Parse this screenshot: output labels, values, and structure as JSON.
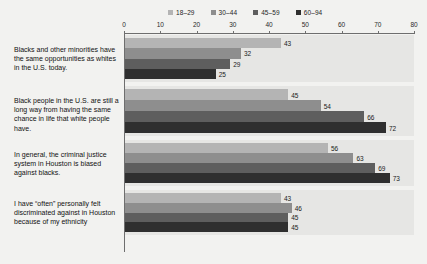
{
  "chart_data": {
    "type": "bar",
    "orientation": "horizontal",
    "title": "",
    "xlabel": "",
    "ylabel": "",
    "xlim": [
      0,
      80
    ],
    "xticks": [
      0,
      10,
      20,
      30,
      40,
      50,
      60,
      70,
      80
    ],
    "grid": false,
    "legend_position": "top",
    "legend": [
      "18–29",
      "30–44",
      "45–59",
      "60–94"
    ],
    "series_colors": [
      "#b4b4b4",
      "#8e8e8e",
      "#5e5e5e",
      "#2f2f2f"
    ],
    "categories": [
      "Blacks and other minorities have the same opportunities as whites in the U.S. today.",
      "Black people in the U.S. are still a long way from having the same chance in life that white people have.",
      "In general, the criminal justice system in Houston is biased against blacks.",
      "I have “often” personally felt discriminated against in Houston because of my ethnicity"
    ],
    "series": [
      {
        "name": "18–29",
        "values": [
          43,
          45,
          56,
          43
        ]
      },
      {
        "name": "30–44",
        "values": [
          32,
          54,
          63,
          46
        ]
      },
      {
        "name": "45–59",
        "values": [
          29,
          66,
          69,
          45
        ]
      },
      {
        "name": "60–94",
        "values": [
          25,
          72,
          73,
          45
        ]
      }
    ]
  },
  "axis": {
    "tick_labels": [
      "0",
      "10",
      "20",
      "30",
      "40",
      "50",
      "60",
      "70",
      "80"
    ]
  },
  "legend": {
    "items": [
      {
        "label": "18–29",
        "color": "#b4b4b4"
      },
      {
        "label": "30–44",
        "color": "#8e8e8e"
      },
      {
        "label": "45–59",
        "color": "#5e5e5e"
      },
      {
        "label": "60–94",
        "color": "#2f2f2f"
      }
    ]
  },
  "categories": [
    {
      "text": "Blacks and other minorities have the same opportunities as whites in the U.S. today."
    },
    {
      "text": "Black people in the U.S. are still a long way from having the same chance in life that white people have."
    },
    {
      "text": "In general, the criminal justice system in Houston is biased against blacks."
    },
    {
      "text": "I have “often” personally felt discriminated against in Houston because of my ethnicity"
    }
  ]
}
